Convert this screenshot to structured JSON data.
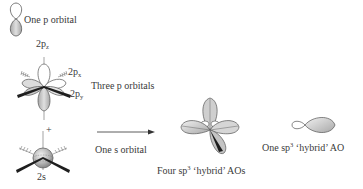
{
  "labels": {
    "one_p_orbital": "One p orbital",
    "p_z": {
      "base": "2p",
      "sub": "z"
    },
    "p_x": {
      "base": "2p",
      "sub": "x"
    },
    "p_y": {
      "base": "2p",
      "sub": "y"
    },
    "three_p_orbitals": "Three p orbitals",
    "plus_sign": "+",
    "two_s": "2s",
    "one_s_orbital": "One s orbital",
    "four_hybrid": {
      "prefix": "Four sp",
      "sup": "3",
      "suffix": " ‘hybrid’ AOs"
    },
    "one_hybrid": {
      "prefix": "One sp",
      "sup": "3",
      "suffix": " ‘hybrid’ AO"
    }
  },
  "colors": {
    "lobe_fill": "#c8c8c8",
    "lobe_light": "#efefef",
    "outline": "#555555",
    "axis_dark": "#1e1e1e",
    "text": "#3a3a3a"
  }
}
